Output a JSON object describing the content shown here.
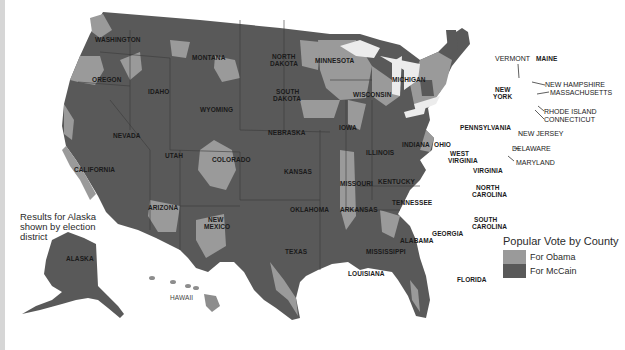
{
  "map": {
    "title": "Popular Vote by County",
    "alaska_note": "Results for Alaska shown by election district",
    "colors": {
      "obama": "#9a9a9a",
      "mccain": "#595959",
      "water": "#ffffff",
      "lakes": "#eaeaea",
      "border": "#3a3a3a"
    },
    "legend": {
      "title": "Popular Vote by County",
      "items": [
        {
          "label": "For Obama",
          "color": "#9a9a9a"
        },
        {
          "label": "For McCain",
          "color": "#595959"
        }
      ]
    },
    "state_labels": {
      "washington": "WASHINGTON",
      "oregon": "OREGON",
      "idaho": "IDAHO",
      "montana": "MONTANA",
      "wyoming": "WYOMING",
      "nevada": "NEVADA",
      "california": "CALIFORNIA",
      "utah": "UTAH",
      "colorado": "COLORADO",
      "arizona": "ARIZONA",
      "new_mexico_1": "NEW",
      "new_mexico_2": "MEXICO",
      "north_dakota_1": "NORTH",
      "north_dakota_2": "DAKOTA",
      "south_dakota_1": "SOUTH",
      "south_dakota_2": "DAKOTA",
      "nebraska": "NEBRASKA",
      "kansas": "KANSAS",
      "oklahoma": "OKLAHOMA",
      "texas": "TEXAS",
      "minnesota": "MINNESOTA",
      "iowa": "IOWA",
      "missouri": "MISSOURI",
      "arkansas": "ARKANSAS",
      "louisiana": "LOUISIANA",
      "wisconsin": "WISCONSIN",
      "illinois": "ILLINOIS",
      "michigan": "MICHIGAN",
      "indiana": "INDIANA",
      "ohio": "OHIO",
      "kentucky": "KENTUCKY",
      "tennessee": "TENNESSEE",
      "mississippi": "MISSISSIPPI",
      "alabama": "ALABAMA",
      "georgia": "GEORGIA",
      "florida": "FLORIDA",
      "south_carolina_1": "SOUTH",
      "south_carolina_2": "CAROLINA",
      "north_carolina_1": "NORTH",
      "north_carolina_2": "CAROLINA",
      "virginia": "VIRGINIA",
      "west_virginia_1": "WEST",
      "west_virginia_2": "VIRGINIA",
      "pennsylvania": "PENNSYLVANIA",
      "new_york_1": "NEW",
      "new_york_2": "YORK",
      "vermont": "VERMONT",
      "maine": "MAINE",
      "new_hampshire": "NEW HAMPSHIRE",
      "massachusetts": "MASSACHUSETTS",
      "rhode_island": "RHODE ISLAND",
      "connecticut": "CONNECTICUT",
      "new_jersey": "NEW JERSEY",
      "delaware": "DELAWARE",
      "maryland": "MARYLAND",
      "alaska": "ALASKA",
      "hawaii": "HAWAII"
    }
  }
}
